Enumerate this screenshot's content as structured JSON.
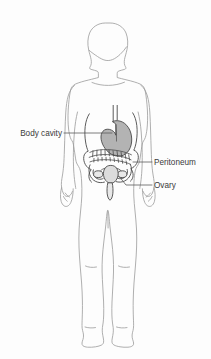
{
  "figure": {
    "background_color": "#fdfdfd",
    "outline_color": "#9a9a9a",
    "organ_outline_color": "#4a4a4a",
    "organ_fill_color": "#b3b3b3",
    "leader_line_color": "#5a5a5a",
    "text_color": "#3b3b3b"
  },
  "labels": [
    {
      "id": "body-cavity",
      "text": "Body cavity",
      "side": "left",
      "text_x": 62,
      "text_y": 133,
      "leader": [
        [
          64,
          133
        ],
        [
          112,
          133
        ]
      ]
    },
    {
      "id": "peritoneum",
      "text": "Peritoneum",
      "side": "right",
      "text_x": 154,
      "text_y": 162,
      "leader": [
        [
          152,
          162
        ],
        [
          133,
          162
        ]
      ]
    },
    {
      "id": "ovary",
      "text": "Ovary",
      "side": "right",
      "text_x": 154,
      "text_y": 185,
      "leader": [
        [
          152,
          185
        ],
        [
          125,
          185
        ],
        [
          118,
          175
        ]
      ]
    }
  ],
  "organs": [
    {
      "id": "stomach",
      "name": "Stomach",
      "filled": true
    },
    {
      "id": "esophagus",
      "name": "Esophagus",
      "filled": false
    },
    {
      "id": "intestines",
      "name": "Intestines",
      "filled": false
    },
    {
      "id": "peritoneal-membrane",
      "name": "Peritoneal membrane",
      "filled": false
    },
    {
      "id": "ovary-left",
      "name": "Left ovary",
      "filled": false
    },
    {
      "id": "ovary-right",
      "name": "Right ovary",
      "filled": false
    },
    {
      "id": "uterus",
      "name": "Uterus",
      "filled": false
    },
    {
      "id": "vagina",
      "name": "Vagina",
      "filled": false
    },
    {
      "id": "pelvis",
      "name": "Pelvic girdle",
      "filled": false
    }
  ],
  "body_parts": [
    {
      "id": "head",
      "name": "Head"
    },
    {
      "id": "neck",
      "name": "Neck"
    },
    {
      "id": "torso",
      "name": "Torso"
    },
    {
      "id": "arm-left",
      "name": "Left arm"
    },
    {
      "id": "arm-right",
      "name": "Right arm"
    },
    {
      "id": "hand-left",
      "name": "Left hand"
    },
    {
      "id": "hand-right",
      "name": "Right hand"
    },
    {
      "id": "leg-left",
      "name": "Left leg"
    },
    {
      "id": "leg-right",
      "name": "Right leg"
    },
    {
      "id": "foot-left",
      "name": "Left foot"
    },
    {
      "id": "foot-right",
      "name": "Right foot"
    }
  ]
}
